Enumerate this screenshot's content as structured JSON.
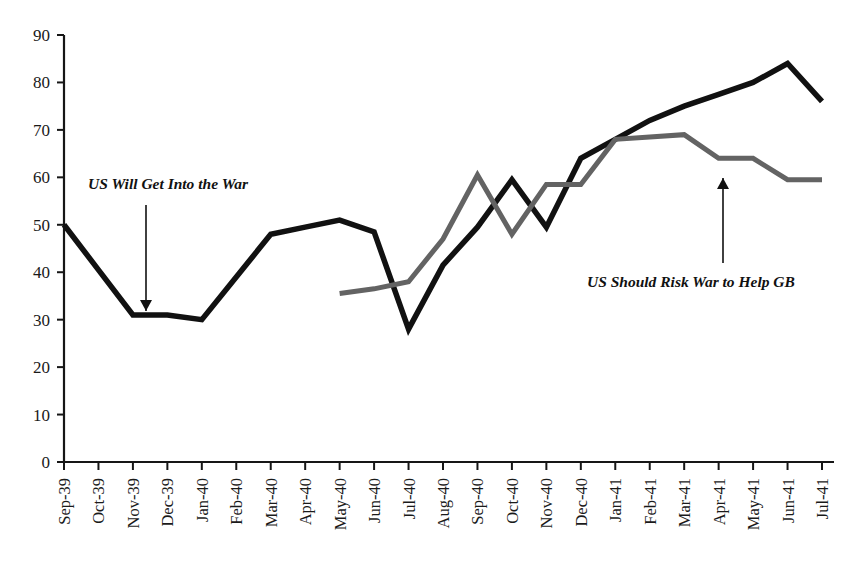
{
  "chart_data": {
    "type": "line",
    "title": "",
    "subtitle": "",
    "xlabel": "",
    "ylabel": "",
    "ylim": [
      0,
      90
    ],
    "ytick_step": 10,
    "grid": false,
    "legend": "none",
    "legend_position": "none",
    "categories": [
      "Sep-39",
      "Oct-39",
      "Nov-39",
      "Dec-39",
      "Jan-40",
      "Feb-40",
      "Mar-40",
      "Apr-40",
      "May-40",
      "Jun-40",
      "Jul-40",
      "Aug-40",
      "Sep-40",
      "Oct-40",
      "Nov-40",
      "Dec-40",
      "Jan-41",
      "Feb-41",
      "Mar-41",
      "Apr-41",
      "May-41",
      "Jun-41",
      "Jul-41"
    ],
    "ytick_labels": [
      "0",
      "10",
      "20",
      "30",
      "40",
      "50",
      "60",
      "70",
      "80",
      "90"
    ],
    "ytick_values": [
      0,
      10,
      20,
      30,
      40,
      50,
      60,
      70,
      80,
      90
    ],
    "series": [
      {
        "name": "US Will Get Into the War",
        "color": "#111111",
        "width": 5.5,
        "values": [
          50,
          40.5,
          31,
          31,
          30,
          39,
          48,
          49.5,
          51,
          48.5,
          28,
          41.5,
          49.5,
          59.5,
          49.5,
          64,
          68,
          72,
          75,
          77.5,
          80,
          84,
          76
        ]
      },
      {
        "name": "US Should Risk War to Help GB",
        "color": "#636363",
        "width": 5.0,
        "values": [
          null,
          null,
          null,
          null,
          null,
          null,
          null,
          null,
          35.5,
          36.5,
          38,
          47,
          60.5,
          48,
          58.5,
          58.5,
          68,
          68.5,
          69,
          64,
          64,
          59.5,
          59.5
        ]
      }
    ],
    "annotations": [
      {
        "text": "US Will Get Into the War",
        "target_category": "Nov-39",
        "target_value": 33,
        "style": "bold-italic"
      },
      {
        "text": "US Should Risk War to Help GB",
        "target_category": "Apr-41",
        "target_value": 62,
        "style": "bold-italic"
      }
    ]
  },
  "axes": {
    "y_axis_name": "y-axis",
    "x_axis_name": "x-axis"
  }
}
